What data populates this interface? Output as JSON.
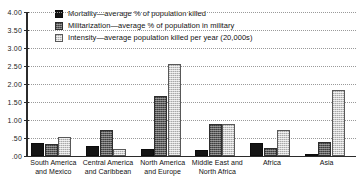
{
  "chart": {
    "title": "",
    "type": "bar"
  },
  "legend": {
    "position": "top-left",
    "items": [
      {
        "key": "mortality",
        "label": "Mortality—average % of population killed",
        "swatch": "black-solid"
      },
      {
        "key": "militarization",
        "label": "Militarization—average % of population in military",
        "swatch": "dark-gray-hatched"
      },
      {
        "key": "intensity",
        "label": "Intensity—average population killed per year (20,000s)",
        "swatch": "light-gray-hatched"
      }
    ]
  },
  "axis": {
    "y": {
      "ticks": [
        "4.00",
        "3.50",
        "3.00",
        "2.50",
        "2.00",
        "1.50",
        "1.00",
        ".50",
        ".00"
      ],
      "min": 0,
      "max": 4,
      "step": 0.5,
      "grid": true
    },
    "x": {
      "categories": [
        {
          "line1": "South America",
          "line2": "and Mexico"
        },
        {
          "line1": "Central America",
          "line2": "and Caribbean"
        },
        {
          "line1": "North America",
          "line2": "and Europe"
        },
        {
          "line1": "Middle East and",
          "line2": "North Africa"
        },
        {
          "line1": "Africa",
          "line2": ""
        },
        {
          "line1": "Asia",
          "line2": ""
        }
      ]
    }
  },
  "chart_data": {
    "type": "bar",
    "title": "",
    "xlabel": "",
    "ylabel": "",
    "ylim": [
      0,
      4
    ],
    "ytick_step": 0.5,
    "grid": true,
    "legend_position": "top-left",
    "categories": [
      "South America and Mexico",
      "Central America and Caribbean",
      "North America and Europe",
      "Middle East and North Africa",
      "Africa",
      "Asia"
    ],
    "series": [
      {
        "name": "Mortality—average % of population killed",
        "color": "#141414",
        "values": [
          0.37,
          0.28,
          0.2,
          0.18,
          0.37,
          0.04
        ]
      },
      {
        "name": "Militarization—average % of population in military",
        "color": "#5d5d5d",
        "values": [
          0.32,
          0.73,
          1.67,
          0.9,
          0.23,
          0.4
        ]
      },
      {
        "name": "Intensity—average population killed per year (20,000s)",
        "color": "#cfcfcf",
        "values": [
          0.54,
          0.2,
          2.55,
          0.88,
          0.73,
          1.83
        ]
      }
    ]
  },
  "colors": {
    "mortality": "#141414",
    "militarization": "#5d5d5d",
    "intensity": "#cfcfcf",
    "axis": "#2b2b2b",
    "grid": "#9a9a9a",
    "background": "#ffffff"
  }
}
